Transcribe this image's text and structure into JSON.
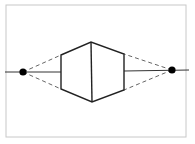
{
  "diagram": {
    "type": "geometric-line-drawing",
    "frame": {
      "x": 6,
      "y": 5,
      "width": 180,
      "height": 132,
      "stroke": "#c8c8c8"
    },
    "axis_line": {
      "left": {
        "x1": 5,
        "y1": 72,
        "x2": 61,
        "y2": 72
      },
      "right": {
        "x1": 124,
        "y1": 71,
        "x2": 189,
        "y2": 70
      }
    },
    "hexagon": {
      "points": [
        [
          61,
          55
        ],
        [
          91,
          42
        ],
        [
          124,
          54
        ],
        [
          124,
          90
        ],
        [
          92,
          102
        ],
        [
          61,
          89
        ]
      ],
      "center_edge": {
        "x1": 91,
        "y1": 42,
        "x2": 92,
        "y2": 102
      },
      "stroke": "#222222"
    },
    "points": [
      {
        "name": "left-point",
        "cx": 23,
        "cy": 72,
        "r": 3.6
      },
      {
        "name": "right-point",
        "cx": 172,
        "cy": 70,
        "r": 3.6
      }
    ],
    "dashed_lines": [
      {
        "x1": 23,
        "y1": 72,
        "x2": 61,
        "y2": 55
      },
      {
        "x1": 23,
        "y1": 72,
        "x2": 61,
        "y2": 89
      },
      {
        "x1": 172,
        "y1": 70,
        "x2": 124,
        "y2": 54
      },
      {
        "x1": 172,
        "y1": 70,
        "x2": 124,
        "y2": 90
      }
    ],
    "colors": {
      "line": "#222222",
      "dash": "#666666",
      "frame": "#c8c8c8",
      "point": "#000000"
    }
  }
}
